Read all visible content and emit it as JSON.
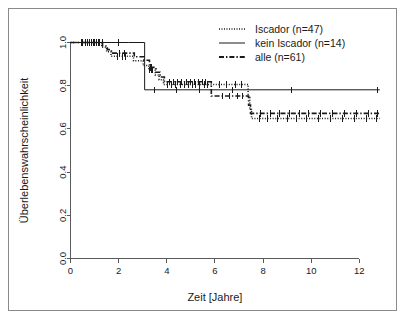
{
  "figure": {
    "border_color": "#8a8a8a",
    "background": "#ffffff",
    "ink_color": "#1a1a1a",
    "axis_color": "#5a5a5a"
  },
  "chart_data": {
    "type": "line",
    "subtype": "kaplan-meier-step",
    "title": "",
    "xlabel": "Zeit [Jahre]",
    "ylabel": "Überlebenswahrscheinlichkeit",
    "xlim": [
      0,
      12.9
    ],
    "ylim": [
      0.0,
      1.0
    ],
    "xticks": [
      0,
      2,
      4,
      6,
      8,
      10,
      12
    ],
    "xticklabels": [
      "0",
      "2",
      "4",
      "6",
      "8",
      "10",
      "12"
    ],
    "yticks": [
      0.0,
      0.2,
      0.4,
      0.6,
      0.8,
      1.0
    ],
    "yticklabels": [
      "0.0",
      "0.2",
      "0.4",
      "0.6",
      "0.8",
      "1.0"
    ],
    "grid": false,
    "legend_position": "top-right",
    "series": [
      {
        "name": "Iscador (n=47)",
        "label": "Iscador (n=47)",
        "linestyle": "dotted",
        "color": "#1a1a1a",
        "points": [
          [
            0.0,
            1.0
          ],
          [
            1.25,
            1.0
          ],
          [
            1.3,
            0.978
          ],
          [
            1.45,
            0.978
          ],
          [
            1.5,
            0.957
          ],
          [
            1.62,
            0.957
          ],
          [
            1.68,
            0.936
          ],
          [
            2.55,
            0.936
          ],
          [
            2.62,
            0.915
          ],
          [
            2.95,
            0.915
          ],
          [
            3.02,
            0.893
          ],
          [
            3.18,
            0.893
          ],
          [
            3.25,
            0.872
          ],
          [
            3.45,
            0.872
          ],
          [
            3.52,
            0.85
          ],
          [
            3.62,
            0.85
          ],
          [
            3.68,
            0.828
          ],
          [
            3.8,
            0.828
          ],
          [
            3.86,
            0.806
          ],
          [
            7.3,
            0.806
          ],
          [
            7.38,
            0.745
          ],
          [
            7.45,
            0.69
          ],
          [
            7.52,
            0.648
          ],
          [
            12.85,
            0.648
          ]
        ],
        "censor_times": [
          0.45,
          0.62,
          0.8,
          0.95,
          1.1,
          1.2,
          1.95,
          2.15,
          2.3,
          3.3,
          3.35,
          3.4,
          4.05,
          4.2,
          4.38,
          4.55,
          4.72,
          4.9,
          5.05,
          5.2,
          5.38,
          5.55,
          5.7,
          6.2,
          6.5,
          6.85,
          7.1,
          7.85,
          8.2,
          8.6,
          9.0,
          9.4,
          9.8,
          10.3,
          10.8,
          11.3,
          11.8,
          12.3,
          12.7
        ]
      },
      {
        "name": "kein Iscador (n=14)",
        "label": "kein Iscador (n=14)",
        "linestyle": "solid",
        "color": "#1a1a1a",
        "points": [
          [
            0.0,
            1.0
          ],
          [
            2.42,
            1.0
          ],
          [
            2.42,
            1.0
          ],
          [
            3.08,
            1.0
          ],
          [
            3.08,
            0.781
          ],
          [
            12.85,
            0.781
          ]
        ],
        "censor_times": [
          1.35,
          2.0,
          3.5,
          4.4,
          5.35,
          6.75,
          9.2,
          12.75
        ]
      },
      {
        "name": "alle (n=61)",
        "label": "alle (n=61)",
        "linestyle": "dashdot",
        "color": "#1a1a1a",
        "points": [
          [
            0.0,
            1.0
          ],
          [
            1.28,
            1.0
          ],
          [
            1.33,
            0.984
          ],
          [
            1.48,
            0.984
          ],
          [
            1.53,
            0.967
          ],
          [
            1.65,
            0.967
          ],
          [
            1.7,
            0.951
          ],
          [
            2.58,
            0.951
          ],
          [
            2.65,
            0.934
          ],
          [
            2.98,
            0.934
          ],
          [
            3.05,
            0.918
          ],
          [
            3.2,
            0.918
          ],
          [
            3.28,
            0.885
          ],
          [
            3.48,
            0.885
          ],
          [
            3.55,
            0.862
          ],
          [
            3.65,
            0.862
          ],
          [
            3.72,
            0.84
          ],
          [
            3.84,
            0.84
          ],
          [
            3.9,
            0.818
          ],
          [
            5.78,
            0.818
          ],
          [
            5.85,
            0.752
          ],
          [
            7.32,
            0.752
          ],
          [
            7.4,
            0.71
          ],
          [
            7.48,
            0.672
          ],
          [
            12.85,
            0.672
          ]
        ],
        "censor_times": [
          0.5,
          0.7,
          0.88,
          1.0,
          1.15,
          2.05,
          2.25,
          3.32,
          3.38,
          4.1,
          4.28,
          4.45,
          4.62,
          4.8,
          4.98,
          5.15,
          5.3,
          5.48,
          5.62,
          6.3,
          6.6,
          6.95,
          7.15,
          7.9,
          8.3,
          8.7,
          9.1,
          9.5,
          9.9,
          10.4,
          10.9,
          11.4,
          11.9,
          12.4,
          12.75
        ]
      }
    ]
  }
}
